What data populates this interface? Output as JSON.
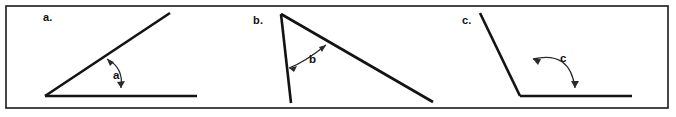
{
  "figure": {
    "background_color": "#ffffff",
    "frame": {
      "name": "outer-border",
      "x": 6,
      "y": 6,
      "width": 662,
      "height": 102,
      "stroke_color": "#1a1a1a",
      "stroke_width": 1.6
    },
    "line_color": "#131313",
    "arc_color": "#2a2a2a",
    "text_color": "#111111"
  },
  "panels": [
    {
      "id": "a",
      "part_label": "a.",
      "part_label_x": 43,
      "part_label_y": 21,
      "angle_label": "a",
      "angle_label_x": 113,
      "angle_label_y": 79,
      "description": "Acute angle opening upward-right from a vertex on a horizontal ray",
      "vertex": {
        "x": 45,
        "y": 96
      },
      "rays": [
        {
          "name": "horizontal-ray",
          "x1": 45,
          "y1": 96,
          "x2": 197,
          "y2": 96
        },
        {
          "name": "diagonal-ray",
          "x1": 45,
          "y1": 96,
          "x2": 170,
          "y2": 13
        }
      ],
      "arc": {
        "path": "M 107 59 Q 124 68 121 88",
        "head_upper": "M 107 59 L 114 62 L 110 66 Z",
        "head_lower": "M 121 88 L 125 81 L 117 82 Z"
      }
    },
    {
      "id": "b",
      "part_label": "b.",
      "part_label_x": 253,
      "part_label_y": 24,
      "angle_label": "b",
      "angle_label_x": 309,
      "angle_label_y": 63,
      "description": "Narrow angle at a top apex between a near-vertical ray and a long descending diagonal ray",
      "vertex": {
        "x": 281,
        "y": 14
      },
      "rays": [
        {
          "name": "near-vertical-ray",
          "x1": 281,
          "y1": 14,
          "x2": 291,
          "y2": 103
        },
        {
          "name": "descending-diagonal-ray",
          "x1": 281,
          "y1": 14,
          "x2": 433,
          "y2": 102
        }
      ],
      "arc": {
        "path": "M 289 68 Q 305 62 326 45",
        "head_left": "M 289 68 L 297 66 L 294 72 Z",
        "head_right": "M 326 45 L 319 47 L 322 52 Z"
      }
    },
    {
      "id": "c",
      "part_label": "c.",
      "part_label_x": 462,
      "part_label_y": 24,
      "angle_label": "c",
      "angle_label_x": 560,
      "angle_label_y": 62,
      "description": "Obtuse angle opening to the right from a vertex where a descending diagonal meets a horizontal ray",
      "vertex": {
        "x": 520,
        "y": 96
      },
      "rays": [
        {
          "name": "diagonal-ray",
          "x1": 520,
          "y1": 96,
          "x2": 480,
          "y2": 13
        },
        {
          "name": "horizontal-ray",
          "x1": 520,
          "y1": 96,
          "x2": 632,
          "y2": 96
        }
      ],
      "arc": {
        "path": "M 533 59 Q 570 50 575 88",
        "head_left": "M 533 59 L 541 59 L 538 65 Z",
        "head_down": "M 575 88 L 571 81 L 579 81 Z"
      }
    }
  ]
}
